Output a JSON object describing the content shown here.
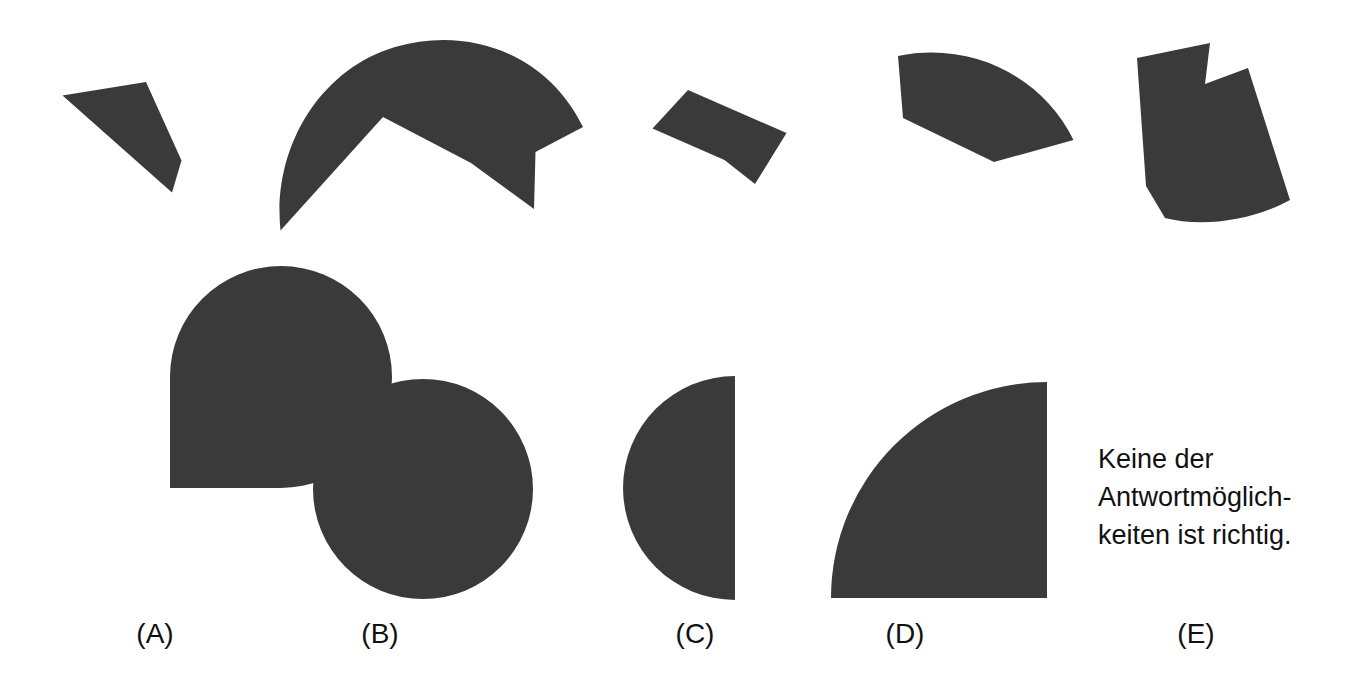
{
  "page": {
    "kind": "multiple-choice-geometry-figure",
    "background_color": "#ffffff",
    "shape_fill_color": "#3a3a3a",
    "text_color": "#111111",
    "width": 1363,
    "height": 699
  },
  "top_row": {
    "description": "Five dark irregular fragment shapes shown in a row across the top",
    "shapes": [
      {
        "id": "fragment-1",
        "name": "quadrilateral-sliver"
      },
      {
        "id": "fragment-2",
        "name": "dome-with-zigzag-base"
      },
      {
        "id": "fragment-3",
        "name": "slanted-quadrilateral"
      },
      {
        "id": "fragment-4",
        "name": "arc-wedge-with-spike"
      },
      {
        "id": "fragment-5",
        "name": "notched-curved-block"
      }
    ]
  },
  "options": [
    {
      "key": "A",
      "label": "(A)",
      "shape": "three-quarter-circle",
      "center_x": 170,
      "center_y": 488,
      "radius": 111,
      "missing_quadrant": "upper-right"
    },
    {
      "key": "B",
      "label": "(B)",
      "shape": "full-circle",
      "center_x": 423,
      "center_y": 489,
      "radius": 110
    },
    {
      "key": "C",
      "label": "(C)",
      "shape": "left-half-circle",
      "center_x": 735,
      "center_y": 488,
      "radius": 112
    },
    {
      "key": "D",
      "label": "(D)",
      "shape": "quarter-circle",
      "corner_x": 1047,
      "corner_y": 598,
      "radius": 216
    },
    {
      "key": "E",
      "label": "(E)",
      "shape": "text-only"
    }
  ],
  "option_labels": {
    "a": "(A)",
    "b": "(B)",
    "c": "(C)",
    "d": "(D)",
    "e": "(E)"
  },
  "option_label_positions": [
    {
      "key": "A",
      "x": 155,
      "y": 634
    },
    {
      "key": "B",
      "x": 380,
      "y": 634
    },
    {
      "key": "C",
      "x": 695,
      "y": 634
    },
    {
      "key": "D",
      "x": 905,
      "y": 634
    },
    {
      "key": "E",
      "x": 1196,
      "y": 634
    }
  ],
  "answer_e": {
    "line1": "Keine der",
    "line2": "Antwortmöglich-",
    "line3": "keiten ist richtig.",
    "full_text": "Keine der\nAntwortmöglich-\nkeiten ist richtig."
  }
}
